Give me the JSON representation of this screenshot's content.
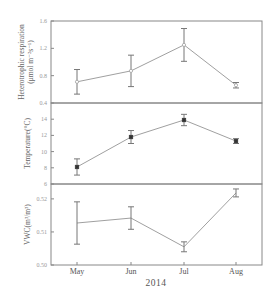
{
  "chart_data": {
    "type": "line",
    "layout": "three vertically stacked panels sharing x-axis",
    "x": [
      "May",
      "Jun",
      "Jul",
      "Aug"
    ],
    "xlabel": "2014",
    "grid": false,
    "legend": null,
    "panels": [
      {
        "id": "heterotrophic-respiration",
        "ylabel_line1": "Heterotrophic respiration",
        "ylabel_line2": "(μmol m⁻²s⁻¹)",
        "ylim": [
          0.4,
          1.6
        ],
        "yticks": [
          0.4,
          0.8,
          1.2,
          1.6
        ],
        "ytick_labels": [
          "0.4",
          "0.8",
          "1.2",
          "1.6"
        ],
        "marker": "open-circle",
        "values": [
          0.71,
          0.87,
          1.25,
          0.66
        ],
        "errors": [
          0.18,
          0.23,
          0.24,
          0.04
        ]
      },
      {
        "id": "temperature",
        "ylabel_line1": "Temperature(°C)",
        "ylabel_line2": "",
        "ylim": [
          6,
          16
        ],
        "yticks": [
          6,
          8,
          10,
          12,
          14
        ],
        "ytick_labels": [
          "6",
          "8",
          "10",
          "12",
          "14"
        ],
        "marker": "filled",
        "values": [
          8.1,
          11.8,
          13.9,
          11.3
        ],
        "errors": [
          1.0,
          0.8,
          0.7,
          0.3
        ]
      },
      {
        "id": "vwc",
        "ylabel_line1": "VWC(m³/m³)",
        "ylabel_line2": "",
        "ylim": [
          0.5,
          0.5245
        ],
        "yticks": [
          0.5,
          0.51,
          0.52
        ],
        "ytick_labels": [
          "0.50",
          "0.51",
          "0.52"
        ],
        "marker": "none",
        "values": [
          0.5127,
          0.5142,
          0.5055,
          0.5218
        ],
        "errors": [
          0.0064,
          0.0034,
          0.0015,
          0.0012
        ]
      }
    ]
  }
}
